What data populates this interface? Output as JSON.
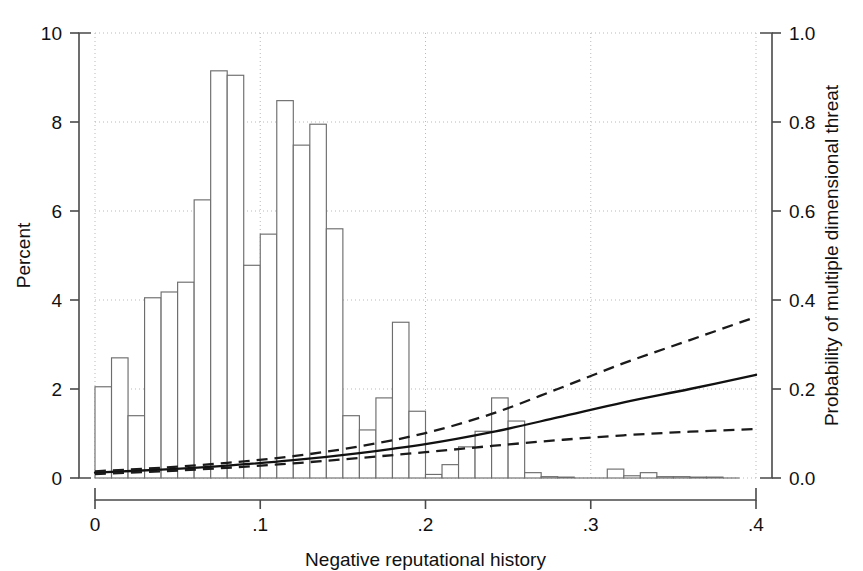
{
  "chart_data": {
    "type": "bar",
    "title": "",
    "subtitle": "",
    "xlabel": "Negative reputational history",
    "ylabel": "Percent",
    "y2label": "Probability of multiple dimensional threat",
    "xlim": [
      0,
      0.4
    ],
    "ylim": [
      0,
      10
    ],
    "y2lim": [
      0.0,
      1.0
    ],
    "xticks": [
      0,
      0.1,
      0.2,
      0.3,
      0.4
    ],
    "xticklabels": [
      "0",
      ".1",
      ".2",
      ".3",
      ".4"
    ],
    "yticks": [
      0,
      2,
      4,
      6,
      8,
      10
    ],
    "yticklabels": [
      "0",
      "2",
      "4",
      "6",
      "8",
      "10"
    ],
    "y2ticks": [
      0.0,
      0.2,
      0.4,
      0.6,
      0.8,
      1.0
    ],
    "y2ticklabels": [
      "0.0",
      "0.2",
      "0.4",
      "0.6",
      "0.8",
      "1.0"
    ],
    "grid": true,
    "legend": null,
    "bin_width": 0.01,
    "histogram": {
      "name": "Percent distribution of negative reputational history",
      "axis": "left",
      "x": [
        0.0,
        0.01,
        0.02,
        0.03,
        0.04,
        0.05,
        0.06,
        0.07,
        0.08,
        0.09,
        0.1,
        0.11,
        0.12,
        0.13,
        0.14,
        0.15,
        0.16,
        0.17,
        0.18,
        0.19,
        0.2,
        0.21,
        0.22,
        0.23,
        0.24,
        0.25,
        0.26,
        0.27,
        0.28,
        0.29,
        0.3,
        0.31,
        0.32,
        0.33,
        0.34,
        0.35,
        0.36,
        0.37,
        0.38
      ],
      "values": [
        2.05,
        2.7,
        1.4,
        4.05,
        4.18,
        4.4,
        6.25,
        9.15,
        9.05,
        4.78,
        5.48,
        8.48,
        7.48,
        7.95,
        5.6,
        1.4,
        1.08,
        1.8,
        3.5,
        1.5,
        0.08,
        0.3,
        0.7,
        1.05,
        1.8,
        1.28,
        0.12,
        0.03,
        0.02,
        0.0,
        0.0,
        0.2,
        0.05,
        0.12,
        0.03,
        0.03,
        0.02,
        0.02,
        0.0
      ]
    },
    "curves": [
      {
        "name": "Predicted probability",
        "style": "solid",
        "axis": "right",
        "x": [
          0.0,
          0.04,
          0.08,
          0.12,
          0.16,
          0.2,
          0.24,
          0.28,
          0.32,
          0.36,
          0.4
        ],
        "y": [
          0.012,
          0.019,
          0.028,
          0.04,
          0.056,
          0.076,
          0.103,
          0.136,
          0.17,
          0.2,
          0.232
        ]
      },
      {
        "name": "Upper 95% confidence interval",
        "style": "dashed",
        "axis": "right",
        "x": [
          0.0,
          0.04,
          0.08,
          0.12,
          0.16,
          0.2,
          0.24,
          0.28,
          0.32,
          0.36,
          0.4
        ],
        "y": [
          0.015,
          0.023,
          0.034,
          0.049,
          0.071,
          0.101,
          0.144,
          0.2,
          0.258,
          0.31,
          0.362
        ]
      },
      {
        "name": "Lower 95% confidence interval",
        "style": "dashed",
        "axis": "right",
        "x": [
          0.0,
          0.04,
          0.08,
          0.12,
          0.16,
          0.2,
          0.24,
          0.28,
          0.32,
          0.36,
          0.4
        ],
        "y": [
          0.009,
          0.015,
          0.023,
          0.033,
          0.045,
          0.058,
          0.072,
          0.085,
          0.096,
          0.104,
          0.11
        ]
      }
    ]
  },
  "colors": {
    "background": "#ffffff",
    "axis": "#4a4a4a",
    "grid": "#b9b9b9",
    "bar_stroke": "#6d6d6d",
    "bar_fill": "#ffffff",
    "curve": "#111111",
    "text": "#111111"
  }
}
